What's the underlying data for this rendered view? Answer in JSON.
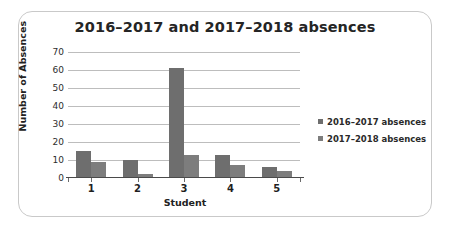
{
  "chart_data": {
    "type": "bar",
    "title": "2016–2017 and 2017–2018 absences",
    "xlabel": "Student",
    "ylabel": "Number of Absences",
    "categories": [
      "1",
      "2",
      "3",
      "4",
      "5"
    ],
    "series": [
      {
        "name": "2016–2017 absences",
        "color": "#6e6e6e",
        "values": [
          15,
          10,
          61,
          13,
          6
        ]
      },
      {
        "name": "2017–2018 absences",
        "color": "#7d7d7d",
        "values": [
          9,
          2,
          13,
          7,
          4
        ]
      }
    ],
    "ylim": [
      0,
      70
    ],
    "yticks": [
      "70",
      "60",
      "50",
      "40",
      "30",
      "20",
      "10",
      "0"
    ],
    "ytick_values": [
      70,
      60,
      50,
      40,
      30,
      20,
      10,
      0
    ],
    "grid": true,
    "legend_position": "right"
  },
  "legend": {
    "entries": [
      {
        "label": "2016–2017 absences",
        "color": "#6e6e6e"
      },
      {
        "label": "2017–2018 absences",
        "color": "#7d7d7d"
      }
    ]
  },
  "colors": {
    "series_2016": "#6e6e6e",
    "series_2017": "#7d7d7d",
    "gridline": "#bdbdbd",
    "axis": "#4a4a4a",
    "frame_border": "#c9c9c9",
    "background": "#ffffff",
    "text": "#252525"
  }
}
